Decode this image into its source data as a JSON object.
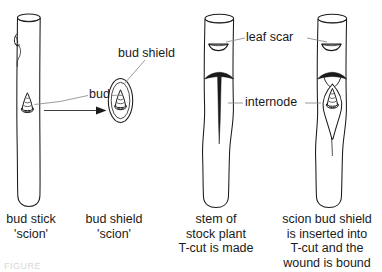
{
  "figure": {
    "title_alt": "Budding / T-budding propagation diagram",
    "bottom_note": "FIGURE"
  },
  "labels": {
    "bud": "bud",
    "bud_shield": "bud shield",
    "leaf_scar": "leaf scar",
    "internode": "internode"
  },
  "captions": [
    {
      "id": "bud-stick",
      "line1": "bud stick",
      "line2": "'scion'"
    },
    {
      "id": "bud-shield",
      "line1": "bud shield",
      "line2": "'scion'"
    },
    {
      "id": "stock-plant",
      "line1": "stem of",
      "line2": "stock plant",
      "line3": "T-cut is made"
    },
    {
      "id": "inserted",
      "line1": "scion bud shield",
      "line2": "is inserted into",
      "line3": "T-cut and the",
      "line4": "wound is bound"
    }
  ],
  "panels": [
    {
      "name": "bud-stick-panel",
      "caption_ref": 0
    },
    {
      "name": "bud-shield-panel",
      "caption_ref": 1
    },
    {
      "name": "stock-plant-panel",
      "caption_ref": 2
    },
    {
      "name": "inserted-bud-panel",
      "caption_ref": 3
    }
  ],
  "colors": {
    "ink": "#1a1a1a",
    "background": "#ffffff",
    "leader": "#8a8a8a",
    "fill": "#ffffff"
  }
}
